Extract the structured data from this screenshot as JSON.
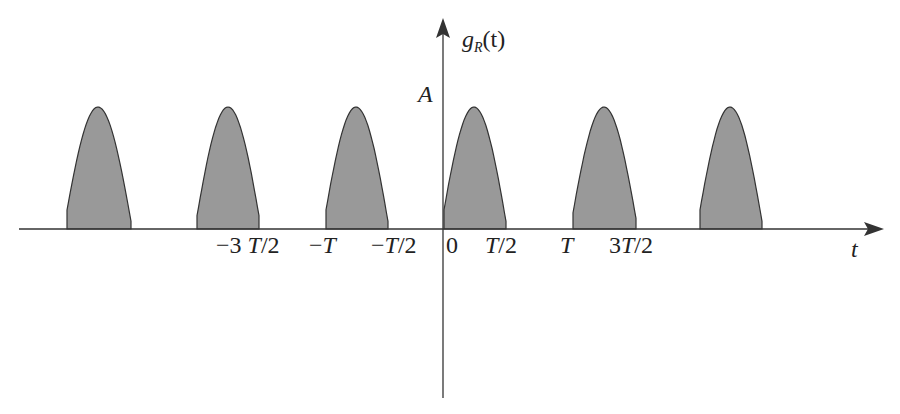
{
  "diagram": {
    "y_axis_label_main": "g",
    "y_axis_label_sub": "R",
    "y_axis_label_arg": "(t)",
    "x_axis_label": "t",
    "amplitude_label": "A",
    "tick_labels": [
      "−3 T/2",
      "−T",
      "−T/2",
      "0",
      "T/2",
      "T",
      "3T/2"
    ],
    "pulse_fill": "#999999",
    "pulse_stroke": "#333333",
    "axis_color": "#333333",
    "pulses": [
      {
        "start": 67,
        "peak": 98,
        "end": 131
      },
      {
        "start": 197,
        "peak": 228,
        "end": 259
      },
      {
        "start": 326,
        "peak": 356,
        "end": 388
      },
      {
        "start": 444,
        "peak": 474,
        "end": 506
      },
      {
        "start": 573,
        "peak": 604,
        "end": 636
      },
      {
        "start": 700,
        "peak": 730,
        "end": 762
      }
    ]
  }
}
